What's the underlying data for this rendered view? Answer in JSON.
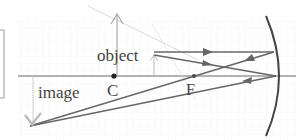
{
  "diagram": {
    "type": "concave-mirror-ray-diagram",
    "labels": {
      "object": "object",
      "image": "image",
      "center": "C",
      "focus": "F"
    },
    "colors": {
      "background": "#ffffff",
      "grid": "#e4e4e4",
      "axis": "#666666",
      "ray": "#666666",
      "mirror": "#444444",
      "object_arrow": "#aaaaaa",
      "image_arrow": "#bbbbbb",
      "text": "#444444"
    }
  }
}
